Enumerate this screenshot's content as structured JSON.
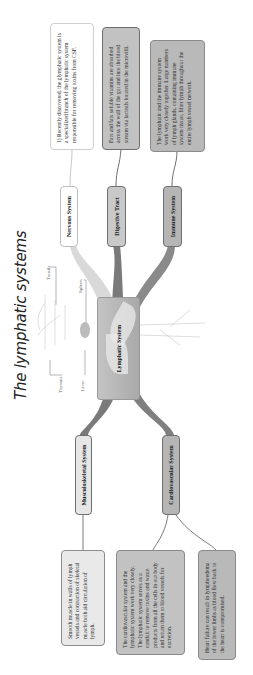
{
  "title": "The lymphatic systems",
  "central_topic": "Lymphatic System",
  "anatomy_labels": {
    "tonsils": "Tonsils",
    "spleen": "Spleen",
    "thymus": "Thymus",
    "liver": "Liver"
  },
  "topics": {
    "nervous": "Nervous System",
    "digestive": "Digestive Tract",
    "immune": "Immune System",
    "musculoskeletal": "Musculoskeletal System",
    "cardiovascular": "Cardiovascular System"
  },
  "notes": {
    "glymphatic": "1) Recently discovered, the glymphatic system is a specialized branch of the lymphatic system responsible for removing toxins from CSF.",
    "digestive": "Fats and fats soluble vitamins are absorbed across the wall of the gut and into the blood stream via lacteals located in the microvilli.",
    "immune": "The lymphatic and the immune system work very closely together. Large numbers of lymph glands, containing immune system tissue, filter lymph throughout the entire lymph vessel network.",
    "musculoskeletal": "Smooth muscle in walls of lymph vessels and contraction of skeletal muscle both aid circulation of lymph.",
    "cardiovascular": "The cardiovascular system and the lymphatic system work very closely. The lymphatic system serves as a conduit to remove toxins and waste products from all the cells in our body and return them to blood vessels for excretion.",
    "heart_failure": "Heart failure can result in lymphoedema of the lower limbs as blood flow back to the heart is compromised."
  },
  "colors": {
    "branch_light": "#d9d9d9",
    "branch_dark": "#7a7a7a",
    "branch_mid": "#8f8f8f",
    "connector": "#8a8a8a"
  }
}
